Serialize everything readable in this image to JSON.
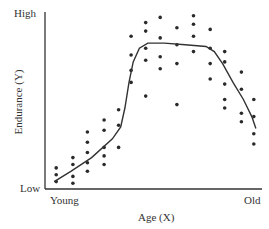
{
  "chart_data": {
    "type": "scatter",
    "title": "",
    "xlabel": "Age (X)",
    "ylabel": "Endurance (Y)",
    "x_tick_labels": [
      "Young",
      "Old"
    ],
    "y_tick_labels": [
      "Low",
      "High"
    ],
    "grid": false,
    "legend": null,
    "axis_ranges": {
      "x": [
        0,
        100
      ],
      "y": [
        0,
        100
      ]
    },
    "series": [
      {
        "name": "observations",
        "kind": "scatter",
        "points": [
          [
            3,
            6
          ],
          [
            3,
            2
          ],
          [
            3,
            10
          ],
          [
            11,
            12
          ],
          [
            11,
            5
          ],
          [
            11,
            16
          ],
          [
            11,
            1
          ],
          [
            18,
            19
          ],
          [
            18,
            13
          ],
          [
            18,
            8
          ],
          [
            18,
            25
          ],
          [
            18,
            31
          ],
          [
            26,
            22
          ],
          [
            26,
            17
          ],
          [
            26,
            32
          ],
          [
            26,
            38
          ],
          [
            26,
            12
          ],
          [
            33,
            22
          ],
          [
            33,
            35
          ],
          [
            33,
            44
          ],
          [
            39,
            67
          ],
          [
            39,
            76
          ],
          [
            39,
            87
          ],
          [
            39,
            60
          ],
          [
            46,
            95
          ],
          [
            46,
            90
          ],
          [
            46,
            80
          ],
          [
            46,
            73
          ],
          [
            46,
            52
          ],
          [
            53,
            98
          ],
          [
            53,
            86
          ],
          [
            53,
            75
          ],
          [
            53,
            68
          ],
          [
            61,
            92
          ],
          [
            61,
            82
          ],
          [
            61,
            71
          ],
          [
            61,
            47
          ],
          [
            69,
            99
          ],
          [
            69,
            94
          ],
          [
            69,
            87
          ],
          [
            69,
            78
          ],
          [
            77,
            91
          ],
          [
            77,
            80
          ],
          [
            77,
            71
          ],
          [
            77,
            62
          ],
          [
            84,
            78
          ],
          [
            84,
            72
          ],
          [
            84,
            59
          ],
          [
            84,
            50
          ],
          [
            84,
            45
          ],
          [
            92,
            66
          ],
          [
            92,
            56
          ],
          [
            92,
            42
          ],
          [
            92,
            37
          ],
          [
            98,
            50
          ],
          [
            98,
            40
          ],
          [
            98,
            30
          ],
          [
            98,
            24
          ]
        ]
      },
      {
        "name": "trend",
        "kind": "line",
        "points": [
          [
            2,
            2
          ],
          [
            10,
            8
          ],
          [
            20,
            16
          ],
          [
            30,
            27
          ],
          [
            34,
            34
          ],
          [
            36,
            45
          ],
          [
            38,
            60
          ],
          [
            40,
            72
          ],
          [
            43,
            80
          ],
          [
            47,
            83
          ],
          [
            55,
            83
          ],
          [
            65,
            82
          ],
          [
            75,
            81
          ],
          [
            79,
            78
          ],
          [
            83,
            71
          ],
          [
            88,
            60
          ],
          [
            93,
            50
          ],
          [
            97,
            40
          ],
          [
            99,
            33
          ]
        ]
      }
    ]
  },
  "axes": {
    "y_high": "High",
    "y_low": "Low",
    "x_left": "Young",
    "x_right": "Old",
    "x_title": "Age (X)",
    "y_title": "Endurance (Y)"
  },
  "colors": {
    "ink": "#2a2a2a",
    "background": "#ffffff"
  }
}
